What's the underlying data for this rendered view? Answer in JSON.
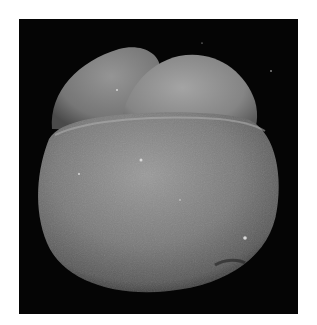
{
  "image": {
    "subject": "foraminifera shell (SEM micrograph)",
    "background_color": "#050505",
    "page_color": "#ffffff",
    "specimen": {
      "chambers": [
        {
          "name": "rear-left-chamber",
          "tone": "#8a8a8a"
        },
        {
          "name": "upper-right-chamber",
          "tone": "#939393"
        },
        {
          "name": "final-chamber",
          "tone": "#7d7d7d"
        }
      ]
    }
  }
}
